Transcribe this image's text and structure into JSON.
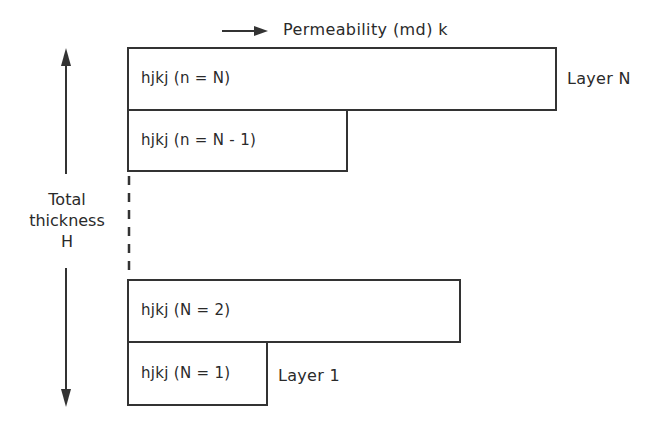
{
  "diagram": {
    "axis_title": "Permeability (md) k",
    "thickness_label": [
      "Total",
      "thickness",
      "H"
    ],
    "layers": [
      {
        "id": "layer-n",
        "label": "hjkj (n = N)",
        "side_label": "Layer N"
      },
      {
        "id": "layer-n-minus-1",
        "label": "hjkj (n = N - 1)",
        "side_label": ""
      },
      {
        "id": "layer-2",
        "label": "hjkj (N = 2)",
        "side_label": ""
      },
      {
        "id": "layer-1",
        "label": "hjkj (N = 1)",
        "side_label": "Layer 1"
      }
    ],
    "colors": {
      "line": "#333333",
      "text": "#2a2a2a",
      "background": "#ffffff"
    }
  }
}
